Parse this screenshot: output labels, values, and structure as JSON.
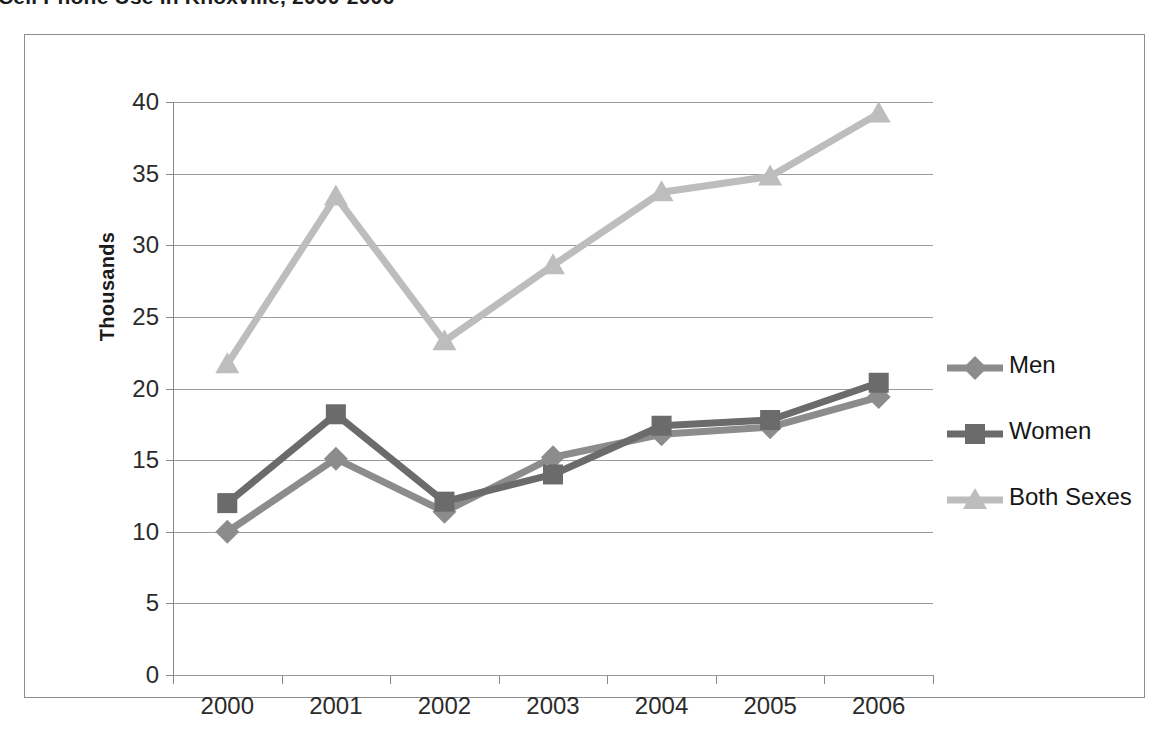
{
  "title": "Cell Phone Use in Knoxville, 2000-2006",
  "legend": {
    "position": "right",
    "entries": [
      {
        "label": "Men",
        "marker": "diamond-marker-icon",
        "color": "#8c8c8c"
      },
      {
        "label": "Women",
        "marker": "square-marker-icon",
        "color": "#6b6b6b"
      },
      {
        "label": "Both Sexes",
        "marker": "triangle-marker-icon",
        "color": "#bdbdbd"
      }
    ]
  },
  "axes": {
    "y_title": "Thousands",
    "y_ticks": [
      "0",
      "5",
      "10",
      "15",
      "20",
      "25",
      "30",
      "35",
      "40"
    ],
    "x_ticks": [
      "2000",
      "2001",
      "2002",
      "2003",
      "2004",
      "2005",
      "2006"
    ]
  },
  "chart_data": {
    "type": "line",
    "title": "Cell Phone Use in Knoxville, 2000-2006",
    "xlabel": "",
    "ylabel": "Thousands",
    "categories": [
      "2000",
      "2001",
      "2002",
      "2003",
      "2004",
      "2005",
      "2006"
    ],
    "series": [
      {
        "name": "Men",
        "marker": "diamond",
        "color": "#8c8c8c",
        "values": [
          10.0,
          15.1,
          11.4,
          15.2,
          16.8,
          17.3,
          19.4
        ]
      },
      {
        "name": "Women",
        "marker": "square",
        "color": "#6b6b6b",
        "values": [
          12.0,
          18.2,
          12.1,
          14.0,
          17.4,
          17.8,
          20.4
        ]
      },
      {
        "name": "Both Sexes",
        "marker": "triangle",
        "color": "#bdbdbd",
        "values": [
          21.7,
          33.4,
          23.3,
          28.6,
          33.7,
          34.8,
          39.2
        ]
      }
    ],
    "ylim": [
      0,
      40
    ],
    "ytick_step": 5,
    "grid": true,
    "legend_position": "right"
  }
}
